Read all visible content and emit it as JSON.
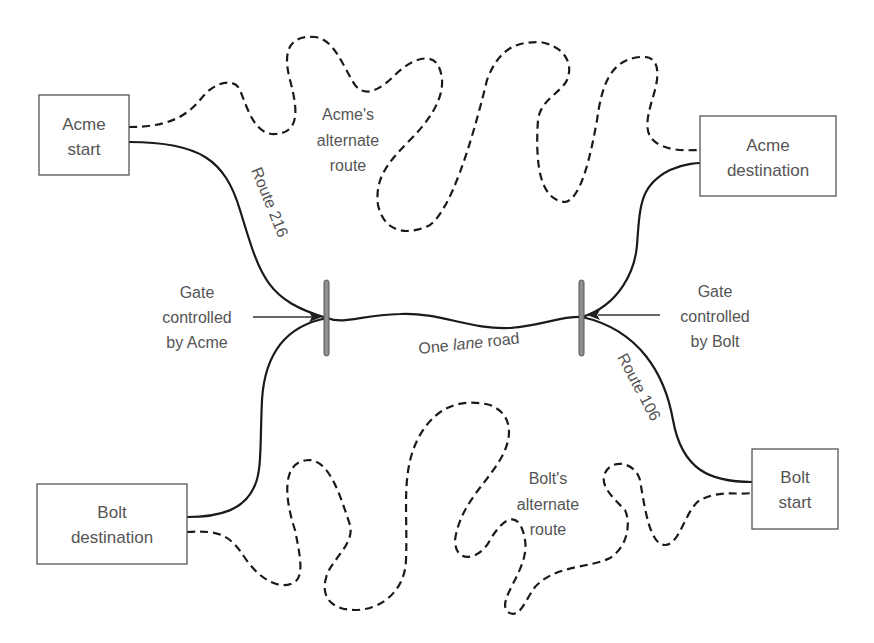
{
  "diagram": {
    "nodes": {
      "acme_start": {
        "line1": "Acme",
        "line2": "start"
      },
      "acme_destination": {
        "line1": "Acme",
        "line2": "destination"
      },
      "bolt_destination": {
        "line1": "Bolt",
        "line2": "destination"
      },
      "bolt_start": {
        "line1": "Bolt",
        "line2": "start"
      }
    },
    "roads": {
      "route_216": "Route 216",
      "route_106": "Route 106",
      "one_lane": {
        "prefix": "One ",
        "italic": "lane",
        "suffix": " road"
      }
    },
    "alternate_routes": {
      "acme": {
        "line1": "Acme's",
        "line2": "alternate",
        "line3": "route"
      },
      "bolt": {
        "line1": "Bolt's",
        "line2": "alternate",
        "line3": "route"
      }
    },
    "gates": {
      "acme": {
        "line1": "Gate",
        "line2": "controlled",
        "line3": "by Acme"
      },
      "bolt": {
        "line1": "Gate",
        "line2": "controlled",
        "line3": "by Bolt"
      }
    },
    "colors": {
      "line": "#1a1a1a",
      "text": "#555555",
      "gate_fill": "#8f8f8f",
      "box_border": "#555555"
    }
  }
}
